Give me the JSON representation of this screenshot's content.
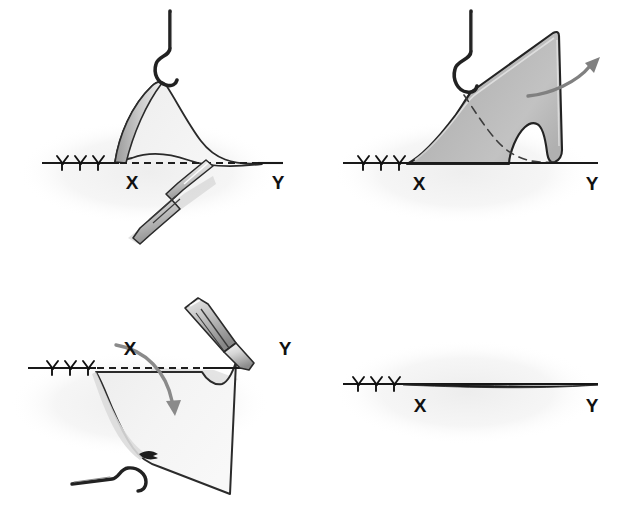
{
  "figure": {
    "panel_count": 4,
    "background_color": "#ffffff",
    "ink_color": "#1a1a1a",
    "flap_fill_light": "#f0f0f0",
    "flap_fill_dark": "#b8b8b8",
    "halo_color": "#f3f3f3",
    "arrow_color": "#808080",
    "shadow_color": "#d0d0d0"
  },
  "panels": [
    {
      "id": "panel-1",
      "name": "flap-undermining",
      "order": "1",
      "labels": {
        "x": "X",
        "y": "Y"
      },
      "elements": [
        "skin-hook",
        "tented-flap",
        "dashed-baseline",
        "suture-line",
        "scalpel"
      ]
    },
    {
      "id": "panel-2",
      "name": "flap-elevated",
      "order": "2",
      "labels": {
        "x": "X",
        "y": "Y"
      },
      "elements": [
        "skin-hook",
        "shaded-flap",
        "dashed-original-contour",
        "suture-line",
        "rotation-arrow"
      ]
    },
    {
      "id": "panel-3",
      "name": "flap-transposed",
      "order": "3",
      "labels": {
        "x": "X",
        "y": "Y"
      },
      "elements": [
        "scalpel",
        "dashed-baseline",
        "folded-flap",
        "suture-line",
        "skin-hook",
        "transposition-arrow",
        "small-direction-arrow"
      ]
    },
    {
      "id": "panel-4",
      "name": "closed-wound",
      "order": "4",
      "labels": {
        "x": "X",
        "y": "Y"
      },
      "elements": [
        "closed-incision-line",
        "suture-line"
      ]
    }
  ],
  "annotations": {
    "x_label": "X",
    "y_label": "Y",
    "suture_stitch_count": 3
  }
}
